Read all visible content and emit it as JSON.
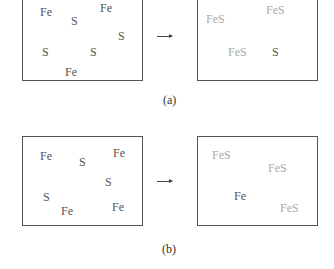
{
  "panel_a": {
    "caption": "(a)",
    "before": {
      "labels": [
        {
          "text": "Fe",
          "x": 40,
          "y": 6,
          "tone": "dark"
        },
        {
          "text": "Fe",
          "x": 100,
          "y": 2,
          "tone": "dark"
        },
        {
          "text": "S",
          "x": 71,
          "y": 15,
          "tone": "dark"
        },
        {
          "text": "S",
          "x": 118,
          "y": 30,
          "tone": "dark"
        },
        {
          "text": "S",
          "x": 42,
          "y": 46,
          "tone": "dark"
        },
        {
          "text": "S",
          "x": 90,
          "y": 46,
          "tone": "dark"
        },
        {
          "text": "Fe",
          "x": 65,
          "y": 66,
          "tone": "dark"
        }
      ]
    },
    "after": {
      "labels": [
        {
          "text": "FeS",
          "x": 206,
          "y": 13,
          "tone": "light"
        },
        {
          "text": "FeS",
          "x": 266,
          "y": 4,
          "tone": "light"
        },
        {
          "text": "FeS",
          "x": 228,
          "y": 46,
          "tone": "light"
        },
        {
          "text": "S",
          "x": 272,
          "y": 46,
          "tone": "dark"
        }
      ]
    }
  },
  "panel_b": {
    "caption": "(b)",
    "before": {
      "labels": [
        {
          "text": "Fe",
          "x": 40,
          "y": 150,
          "tone": "dark"
        },
        {
          "text": "S",
          "x": 79,
          "y": 156,
          "tone": "dark"
        },
        {
          "text": "Fe",
          "x": 113,
          "y": 147,
          "tone": "dark"
        },
        {
          "text": "S",
          "x": 105,
          "y": 176,
          "tone": "dark"
        },
        {
          "text": "S",
          "x": 43,
          "y": 191,
          "tone": "dark"
        },
        {
          "text": "Fe",
          "x": 61,
          "y": 205,
          "tone": "dark"
        },
        {
          "text": "Fe",
          "x": 112,
          "y": 201,
          "tone": "dark"
        }
      ]
    },
    "after": {
      "labels": [
        {
          "text": "FeS",
          "x": 212,
          "y": 149,
          "tone": "light"
        },
        {
          "text": "FeS",
          "x": 268,
          "y": 162,
          "tone": "light"
        },
        {
          "text": "Fe",
          "x": 234,
          "y": 190,
          "tone": "dark"
        },
        {
          "text": "FeS",
          "x": 280,
          "y": 202,
          "tone": "light"
        }
      ]
    }
  },
  "arrow_glyph": "→",
  "colors": {
    "dark_text": "#555555",
    "light_text": "#aaaaaa",
    "border": "#555555"
  }
}
